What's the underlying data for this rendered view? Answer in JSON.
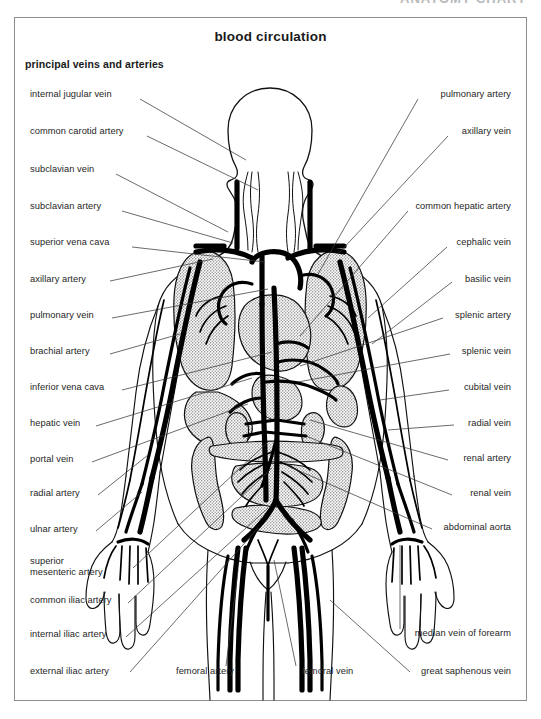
{
  "page": {
    "clipped_header_text": "ANATOMY CHART",
    "title": "blood circulation",
    "subtitle": "principal veins and arteries"
  },
  "diagram": {
    "kind": "anatomical-illustration",
    "style": "black-and-white line art with stippled gray organ shading",
    "colors": {
      "background": "#ffffff",
      "ink": "#111111",
      "leader_line": "#3a3a3a",
      "organ_stipple": "#b3b3b3",
      "frame_border": "#8d8d8d"
    }
  },
  "labels_left": [
    {
      "text": "internal jugular vein",
      "x": 30,
      "y": 95,
      "lx": 140,
      "ly": 99,
      "tx": 246,
      "ty": 160
    },
    {
      "text": "common carotid artery",
      "x": 30,
      "y": 132,
      "lx": 147,
      "ly": 136,
      "tx": 258,
      "ty": 190
    },
    {
      "text": "subclavian vein",
      "x": 30,
      "y": 170,
      "lx": 116,
      "ly": 174,
      "tx": 228,
      "ty": 232
    },
    {
      "text": "subclavian artery",
      "x": 30,
      "y": 207,
      "lx": 122,
      "ly": 211,
      "tx": 233,
      "ty": 243
    },
    {
      "text": "superior vena cava",
      "x": 30,
      "y": 243,
      "lx": 132,
      "ly": 247,
      "tx": 265,
      "ty": 262
    },
    {
      "text": "axillary artery",
      "x": 30,
      "y": 280,
      "lx": 110,
      "ly": 281,
      "tx": 213,
      "ty": 259
    },
    {
      "text": "pulmonary vein",
      "x": 30,
      "y": 316,
      "lx": 112,
      "ly": 318,
      "tx": 268,
      "ty": 289
    },
    {
      "text": "brachial artery",
      "x": 30,
      "y": 352,
      "lx": 110,
      "ly": 354,
      "tx": 180,
      "ty": 334
    },
    {
      "text": "inferior vena cava",
      "x": 30,
      "y": 388,
      "lx": 122,
      "ly": 390,
      "tx": 272,
      "ty": 352
    },
    {
      "text": "hepatic vein",
      "x": 30,
      "y": 424,
      "lx": 96,
      "ly": 426,
      "tx": 252,
      "ty": 378
    },
    {
      "text": "portal vein",
      "x": 30,
      "y": 460,
      "lx": 92,
      "ly": 462,
      "tx": 248,
      "ty": 404
    },
    {
      "text": "radial artery",
      "x": 30,
      "y": 494,
      "lx": 98,
      "ly": 495,
      "tx": 148,
      "ty": 455
    },
    {
      "text": "ulnar artery",
      "x": 30,
      "y": 530,
      "lx": 96,
      "ly": 531,
      "tx": 142,
      "ty": 492
    },
    {
      "text": "superior",
      "x": 30,
      "y": 562,
      "lx": 0,
      "ly": 0,
      "tx": 0,
      "ty": 0
    },
    {
      "text": "mesenteric artery",
      "x": 30,
      "y": 573,
      "lx": 133,
      "ly": 568,
      "tx": 268,
      "ty": 442
    },
    {
      "text": "common iliac artery",
      "x": 30,
      "y": 601,
      "lx": 128,
      "ly": 603,
      "tx": 272,
      "ty": 468
    },
    {
      "text": "internal iliac artery",
      "x": 30,
      "y": 635,
      "lx": 126,
      "ly": 637,
      "tx": 268,
      "ty": 508
    },
    {
      "text": "external iliac artery",
      "x": 30,
      "y": 672,
      "lx": 130,
      "ly": 672,
      "tx": 258,
      "ty": 528
    }
  ],
  "labels_right": [
    {
      "text": "pulmonary artery",
      "x": 511,
      "y": 95,
      "lx": 418,
      "ly": 99,
      "tx": 318,
      "ty": 274
    },
    {
      "text": "axillary vein",
      "x": 511,
      "y": 132,
      "lx": 448,
      "ly": 136,
      "tx": 338,
      "ty": 254
    },
    {
      "text": "common hepatic artery",
      "x": 511,
      "y": 207,
      "lx": 408,
      "ly": 211,
      "tx": 300,
      "ty": 336
    },
    {
      "text": "cephalic vein",
      "x": 511,
      "y": 243,
      "lx": 447,
      "ly": 247,
      "tx": 368,
      "ty": 318
    },
    {
      "text": "basilic vein",
      "x": 511,
      "y": 280,
      "lx": 452,
      "ly": 282,
      "tx": 372,
      "ty": 344
    },
    {
      "text": "splenic artery",
      "x": 511,
      "y": 316,
      "lx": 443,
      "ly": 318,
      "tx": 300,
      "ty": 366
    },
    {
      "text": "splenic vein",
      "x": 511,
      "y": 352,
      "lx": 450,
      "ly": 354,
      "tx": 298,
      "ty": 382
    },
    {
      "text": "cubital vein",
      "x": 511,
      "y": 388,
      "lx": 449,
      "ly": 390,
      "tx": 380,
      "ty": 400
    },
    {
      "text": "radial vein",
      "x": 511,
      "y": 424,
      "lx": 454,
      "ly": 425,
      "tx": 388,
      "ty": 430
    },
    {
      "text": "renal artery",
      "x": 511,
      "y": 459,
      "lx": 448,
      "ly": 460,
      "tx": 310,
      "ty": 420
    },
    {
      "text": "renal vein",
      "x": 511,
      "y": 494,
      "lx": 452,
      "ly": 495,
      "tx": 306,
      "ty": 436
    },
    {
      "text": "abdominal aorta",
      "x": 511,
      "y": 528,
      "lx": 432,
      "ly": 529,
      "tx": 288,
      "ty": 466
    },
    {
      "text": "median vein of forearm",
      "x": 511,
      "y": 634,
      "lx": 400,
      "ly": 629,
      "tx": 400,
      "ty": 545
    },
    {
      "text": "great saphenous vein",
      "x": 511,
      "y": 672,
      "lx": 410,
      "ly": 672,
      "tx": 330,
      "ty": 600
    }
  ],
  "labels_bottom": [
    {
      "text": "femoral artery",
      "x": 176,
      "y": 672,
      "lx": 226,
      "ly": 666,
      "tx": 238,
      "ty": 570
    },
    {
      "text": "femoral vein",
      "x": 302,
      "y": 672,
      "lx": 296,
      "ly": 666,
      "tx": 274,
      "ty": 560
    }
  ],
  "structure_counts": {
    "left_labels": 17,
    "right_labels": 14,
    "bottom_labels": 2,
    "total_labels": 33
  }
}
